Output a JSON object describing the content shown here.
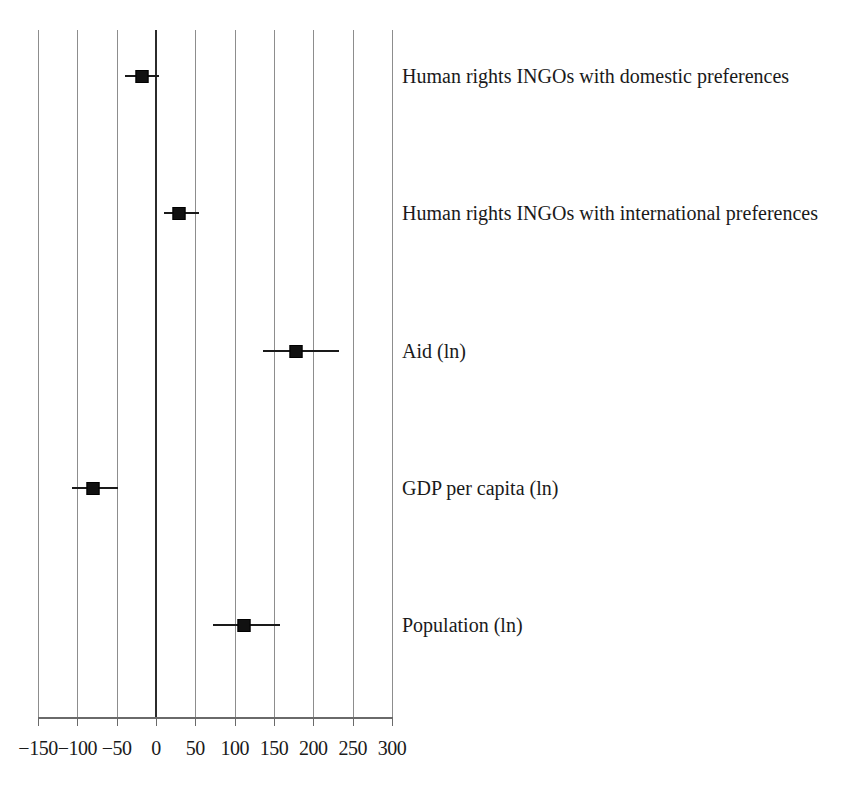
{
  "chart_data": {
    "type": "scatter",
    "title": "",
    "subtitle": "",
    "xlabel": "",
    "ylabel": "",
    "xlim": [
      -150,
      300
    ],
    "xticks": [
      -150,
      -100,
      -50,
      0,
      50,
      100,
      150,
      200,
      250,
      300
    ],
    "xticklabels": [
      "−150",
      "−100",
      "−50",
      "0",
      "50",
      "100",
      "150",
      "200",
      "250",
      "300"
    ],
    "grid": true,
    "grid_axis": "x",
    "legend": "none",
    "reference_line": 0,
    "orientation": "horizontal",
    "marker": "filled-square",
    "error_bars": "horizontal confidence intervals",
    "categories": [
      "Human rights INGOs with domestic preferences",
      "Human rights INGOs with international preferences",
      "Aid (ln)",
      "GDP per capita (ln)",
      "Population (ln)"
    ],
    "points": [
      {
        "label": "Human rights INGOs with domestic preferences",
        "estimate": -18,
        "ci_low": -39,
        "ci_high": 4
      },
      {
        "label": "Human rights INGOs with international preferences",
        "estimate": 29,
        "ci_low": 10,
        "ci_high": 55
      },
      {
        "label": "Aid (ln)",
        "estimate": 178,
        "ci_low": 136,
        "ci_high": 232
      },
      {
        "label": "GDP per capita (ln)",
        "estimate": -80,
        "ci_low": -107,
        "ci_high": -48
      },
      {
        "label": "Population (ln)",
        "estimate": 112,
        "ci_low": 73,
        "ci_high": 157
      }
    ],
    "colors": {
      "marker": "#111111",
      "error_bar": "#1a1a1a",
      "gridline": "#8d8d8d",
      "zero_line": "#2b2b2b",
      "axis": "#6a6a6a",
      "text": "#1a1a1a",
      "background": "#ffffff"
    }
  }
}
